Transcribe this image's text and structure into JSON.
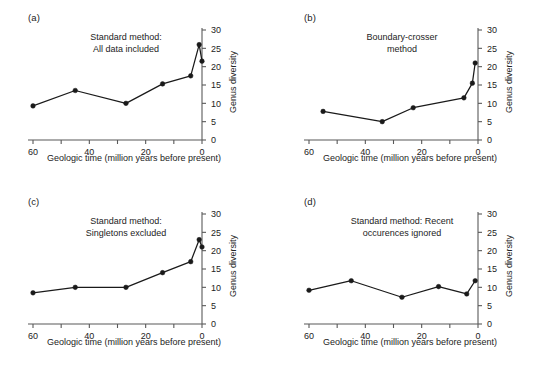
{
  "figure": {
    "width": 552,
    "height": 368,
    "background": "#ffffff",
    "line_color": "#1a1a1a",
    "marker_color": "#1a1a1a",
    "axis_color": "#595959"
  },
  "axes_common": {
    "xlabel": "Geologic time (million years before present)",
    "ylabel": "Genus diversity",
    "xlim": [
      62,
      -3
    ],
    "ylim": [
      0,
      30
    ],
    "xticks": [
      60,
      50,
      40,
      30,
      20,
      10,
      0
    ],
    "xtick_labels": [
      "60",
      "",
      "40",
      "",
      "20",
      "",
      "0"
    ],
    "yticks": [
      0,
      5,
      10,
      15,
      20,
      25,
      30
    ],
    "ytick_labels": [
      "0",
      "5",
      "10",
      "15",
      "20",
      "25",
      "30"
    ],
    "grid": false,
    "legend": "none",
    "y_axis_side": "right"
  },
  "chart_data": [
    {
      "type": "line",
      "panel": "a",
      "panel_label": "(a)",
      "title": "Standard method:\nAll data included",
      "title_lines": [
        "Standard method:",
        "All data included"
      ],
      "xlabel": "Geologic time (million years before present)",
      "ylabel": "Genus diversity",
      "xlim": [
        62,
        -3
      ],
      "ylim": [
        0,
        30
      ],
      "x": [
        60,
        45,
        27,
        14,
        4,
        1,
        0
      ],
      "y": [
        9.3,
        13.5,
        10.0,
        15.3,
        17.5,
        26.0,
        21.5
      ],
      "marker": "filled-circle"
    },
    {
      "type": "line",
      "panel": "b",
      "panel_label": "(b)",
      "title": "Boundary-crosser\nmethod",
      "title_lines": [
        "Boundary-crosser",
        "method"
      ],
      "xlabel": "Geologic time (million years before present)",
      "ylabel": "Genus diversity",
      "xlim": [
        62,
        -3
      ],
      "ylim": [
        0,
        30
      ],
      "x": [
        55,
        34,
        23,
        5,
        2,
        1
      ],
      "y": [
        7.8,
        5.0,
        8.8,
        11.5,
        15.5,
        21.0
      ],
      "marker": "filled-circle"
    },
    {
      "type": "line",
      "panel": "c",
      "panel_label": "(c)",
      "title": "Standard method:\nSingletons excluded",
      "title_lines": [
        "Standard method:",
        "Singletons excluded"
      ],
      "xlabel": "Geologic time (million years before present)",
      "ylabel": "Genus diversity",
      "xlim": [
        62,
        -3
      ],
      "ylim": [
        0,
        30
      ],
      "x": [
        60,
        45,
        27,
        14,
        4,
        1,
        0
      ],
      "y": [
        8.5,
        10.0,
        10.0,
        14.0,
        17.0,
        23.0,
        21.0
      ],
      "marker": "filled-circle"
    },
    {
      "type": "line",
      "panel": "d",
      "panel_label": "(d)",
      "title": "Standard method: Recent\noccurences ignored",
      "title_lines": [
        "Standard method: Recent",
        "occurences ignored"
      ],
      "xlabel": "Geologic time (million years before present)",
      "ylabel": "Genus diversity",
      "xlim": [
        62,
        -3
      ],
      "ylim": [
        0,
        30
      ],
      "x": [
        60,
        45,
        27,
        14,
        4,
        1
      ],
      "y": [
        9.2,
        11.8,
        7.3,
        10.2,
        8.2,
        11.8
      ],
      "marker": "filled-circle"
    }
  ]
}
